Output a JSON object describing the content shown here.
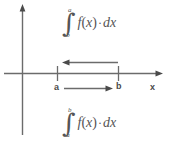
{
  "figure": {
    "background_color": "#ffffff",
    "stroke_color": "#6b6b6b",
    "text_color": "#555555"
  },
  "expressions": {
    "top": {
      "integral_sign": "∫",
      "upper_limit": "a",
      "lower_limit": "b",
      "integrand_f": "f",
      "open_paren": "(",
      "variable": "x",
      "close_paren": ")",
      "dot": "·",
      "differential_d": "d",
      "differential_var": "x"
    },
    "bottom": {
      "integral_sign": "∫",
      "upper_limit": "b",
      "lower_limit": "a",
      "integrand_f": "f",
      "open_paren": "(",
      "variable": "x",
      "close_paren": ")",
      "dot": "·",
      "differential_d": "d",
      "differential_var": "x"
    }
  },
  "axis": {
    "x_axis_label": "x",
    "point_a_label": "a",
    "point_b_label": "b"
  },
  "arrows": {
    "upper": {
      "direction": "left",
      "from": "b",
      "to": "a"
    },
    "lower": {
      "direction": "right",
      "from": "a",
      "to": "b"
    }
  }
}
